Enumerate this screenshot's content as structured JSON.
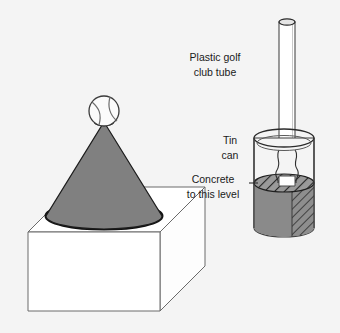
{
  "figure": {
    "kind": "technical-illustration",
    "background_color": "#f4f4f4"
  },
  "labels": [
    {
      "id": "plastic-golf-club-tube",
      "lines": [
        "Plastic golf",
        "club tube"
      ],
      "x": 215,
      "y": 64
    },
    {
      "id": "tin-can",
      "lines": [
        "Tin",
        "can"
      ],
      "x": 230,
      "y": 147
    },
    {
      "id": "concrete-to-this-level",
      "lines": [
        "Concrete",
        "to this level"
      ],
      "x": 215,
      "y": 186
    }
  ],
  "parts": {
    "ball": {
      "name": "ball",
      "cx": 104,
      "cy": 111,
      "r": 15,
      "fill": "#fbfbfb",
      "stroke": "#3a3a3a"
    },
    "cone": {
      "name": "cone",
      "apex_x": 104,
      "apex_y": 124,
      "base_cy": 216,
      "base_rx": 58,
      "base_ry": 13,
      "fill": "#808080",
      "stroke": "#1c1c1c"
    },
    "cube": {
      "name": "cube-base",
      "front_left_x": 28,
      "front_right_x": 160,
      "top_y": 232,
      "bottom_y": 311,
      "depth_x": 45,
      "depth_y": 45,
      "fill": "#ffffff",
      "stroke": "#5a5a5a"
    },
    "tube": {
      "name": "plastic-golf-club-tube",
      "cx": 287,
      "top_y": 22,
      "bottom_y": 176,
      "rx": 8,
      "ry": 3.2,
      "fill": "#ffffff",
      "stroke": "#4a4a4a"
    },
    "can": {
      "name": "tin-can",
      "cx": 284,
      "rim_y": 138,
      "base_y": 228,
      "rx": 30,
      "ry": 9,
      "fill": "#f2f2f2",
      "stroke": "#3d3d3d"
    },
    "concrete": {
      "name": "concrete-fill",
      "surface_y": 183,
      "fill": "#8a8a8a",
      "hatch_stroke": "#2a2a2a",
      "level_note": "Concrete to this level"
    },
    "leader_line": {
      "name": "concrete-level-leader",
      "from_x": 249,
      "from_y": 183,
      "to_x": 258,
      "to_y": 183
    }
  },
  "colors": {
    "background": "#f4f4f4",
    "cone_gray": "#808080",
    "concrete_gray": "#8a8a8a",
    "outline_dark": "#1c1c1c",
    "outline_mid": "#4a4a4a",
    "paper_white": "#ffffff",
    "text": "#1a1a1a"
  }
}
